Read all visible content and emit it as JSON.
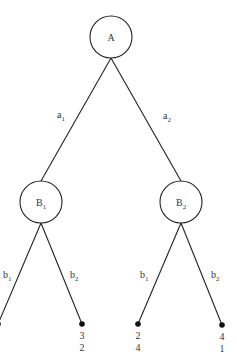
{
  "diagram": {
    "type": "game-tree",
    "root": {
      "id": "A",
      "label": "A",
      "cx": 111,
      "cy": 37,
      "r": 21
    },
    "decision_nodes": [
      {
        "id": "B1",
        "label": "B",
        "sub": "1",
        "cx": 41,
        "cy": 202,
        "r": 21
      },
      {
        "id": "B2",
        "label": "B",
        "sub": "2",
        "cx": 181,
        "cy": 202,
        "r": 21
      }
    ],
    "root_actions": [
      {
        "label": "a",
        "sub": "1",
        "from": "A",
        "to": "B1",
        "lx": 57,
        "ly": 118
      },
      {
        "label": "a",
        "sub": "2",
        "from": "A",
        "to": "B2",
        "lx": 163,
        "ly": 119
      }
    ],
    "b_actions": [
      {
        "label": "b",
        "sub": "1",
        "from": "B1",
        "lx": 3,
        "ly": 278
      },
      {
        "label": "b",
        "sub": "2",
        "from": "B1",
        "lx": 70,
        "ly": 278
      },
      {
        "label": "b",
        "sub": "1",
        "from": "B2",
        "lx": 140,
        "ly": 278
      },
      {
        "label": "b",
        "sub": "2",
        "from": "B2",
        "lx": 211,
        "ly": 278
      }
    ],
    "leaves": [
      {
        "id": "leaf-1",
        "x": -2,
        "y": 324,
        "payoff_top": "",
        "payoff_bottom": ""
      },
      {
        "id": "leaf-2",
        "x": 82,
        "y": 324,
        "payoff_top": "3",
        "payoff_bottom": "2"
      },
      {
        "id": "leaf-3",
        "x": 138,
        "y": 324,
        "payoff_top": "2",
        "payoff_bottom": "4"
      },
      {
        "id": "leaf-4",
        "x": 222,
        "y": 325,
        "payoff_top": "4",
        "payoff_bottom": "1"
      }
    ]
  }
}
